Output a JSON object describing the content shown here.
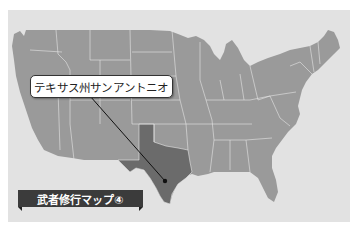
{
  "map": {
    "region": "United States (contiguous)",
    "highlighted_state": "Texas",
    "colors": {
      "background": "#e2e2e2",
      "states": "#9a9a9a",
      "highlight": "#6b6b6b",
      "borders": "#e8e8e8",
      "marker": "#111111"
    }
  },
  "callout": {
    "label": "テキサス州サンアントニオ"
  },
  "banner": {
    "label": "武者修行マップ④"
  }
}
